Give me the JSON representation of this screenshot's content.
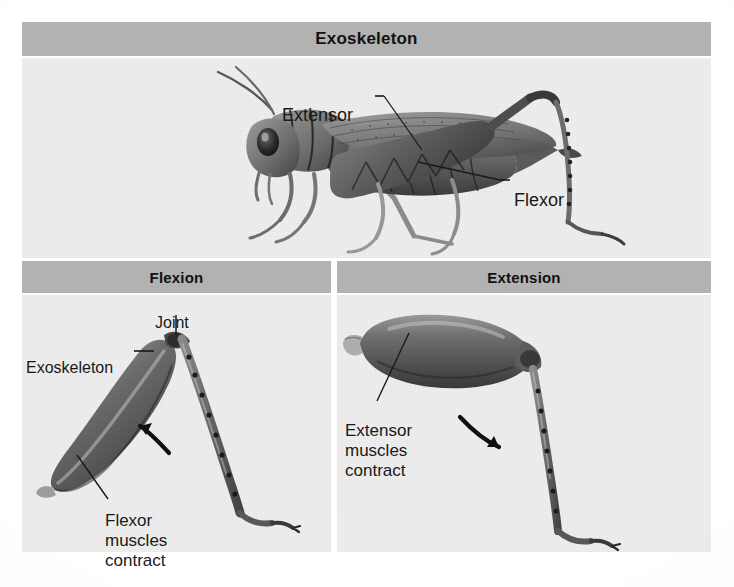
{
  "figure": {
    "title": "Exoskeleton",
    "style": {
      "header_bg": "#b2b2b2",
      "panel_bg": "#efefef",
      "page_bg": "#ffffff",
      "text_color": "#1a1a1a",
      "illustration_ink": "#4a4a4a"
    }
  },
  "panels": [
    {
      "id": "exoskeleton",
      "header": "Exoskeleton",
      "illustration": "grasshopper-lateral-view",
      "labels": [
        {
          "id": "extensor",
          "text": "Extensor"
        },
        {
          "id": "flexor",
          "text": "Flexor"
        }
      ]
    },
    {
      "id": "flexion",
      "header": "Flexion",
      "illustration": "grasshopper-hind-leg-flexed",
      "labels": [
        {
          "id": "joint",
          "text": "Joint"
        },
        {
          "id": "exoskeleton",
          "text": "Exoskeleton"
        },
        {
          "id": "flexor-muscles-contract",
          "text": "Flexor\nmuscles\ncontract"
        }
      ],
      "arrow": {
        "id": "flexion-arrow",
        "direction": "counter-clockwise"
      }
    },
    {
      "id": "extension",
      "header": "Extension",
      "illustration": "grasshopper-hind-leg-extended",
      "labels": [
        {
          "id": "extensor-muscles-contract",
          "text": "Extensor\nmuscles\ncontract"
        }
      ],
      "arrow": {
        "id": "extension-arrow",
        "direction": "clockwise"
      }
    }
  ]
}
